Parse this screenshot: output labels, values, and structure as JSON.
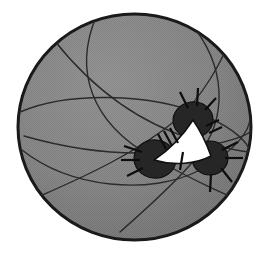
{
  "figure": {
    "kind": "spherical-triangle-diagram",
    "caption": "",
    "background_color": "#ffffff",
    "canvas": {
      "width": 268,
      "height": 255
    }
  },
  "sphere": {
    "label": "sphere",
    "center_x": 134.5,
    "center_y": 127,
    "radius_x": 116.5,
    "radius_y": 113,
    "fill_color": "#8a8a8a",
    "outline_color": "#1a1a1a",
    "outline_width": 3,
    "shading": "dithered-halftone-gray",
    "highlight_color": "#9b9b9b",
    "shadow_color": "#6f6f6f"
  },
  "great_circles": {
    "label": "great circle arcs",
    "stroke_color": "#2b2b2b",
    "stroke_width": 1.4,
    "count": 7,
    "paths": [
      "M 22 150 C 70 188, 150 196, 200 170 C 236 151, 250 130, 250 118",
      "M 20 112 C 66 92, 150 92, 205 116 C 238 130, 249 145, 250 152",
      "M 96 17 C 74 70, 90 122, 152 157 C 196 182, 232 198, 246 202",
      "M 188 20 C 228 66, 228 120, 196 158 C 172 187, 140 214, 120 232",
      "M 54 40 C 92 88, 140 124, 196 140 C 228 149, 244 152, 251 152",
      "M 40 196 C 86 176, 138 152, 176 120 C 204 96, 222 60, 230 40",
      "M 24 136 C 80 152, 140 158, 196 148 C 228 142, 246 136, 251 131"
    ]
  },
  "spherical_triangle": {
    "label": "spherical triangle",
    "fill_color": "#ffffff",
    "outline_color": "#111111",
    "outline_width": 1.6,
    "vertices": [
      {
        "name": "apex-vertex",
        "x": 193,
        "y": 120
      },
      {
        "name": "left-vertex",
        "x": 157,
        "y": 159
      },
      {
        "name": "right-vertex",
        "x": 209,
        "y": 157
      }
    ],
    "path": "M 193 120 C 184 134, 172 148, 154 160 C 174 166, 196 164, 211 156 C 206 142, 200 130, 193 120 Z"
  },
  "vertex_nodes": {
    "label": "vertex blobs",
    "fill_color": "#262626",
    "outline_color": "#111111",
    "nodes": [
      {
        "name": "vertex-node-top",
        "cx": 193,
        "cy": 120,
        "rx": 20,
        "ry": 18,
        "rotation": -8
      },
      {
        "name": "vertex-node-left",
        "cx": 155,
        "cy": 159,
        "rx": 21,
        "ry": 19,
        "rotation": 6
      },
      {
        "name": "vertex-node-right",
        "cx": 210,
        "cy": 158,
        "rx": 18,
        "ry": 17,
        "rotation": -4
      }
    ]
  },
  "tick_marks": {
    "label": "tick marks / hatch marks",
    "stroke_color": "#0d0d0d",
    "stroke_width": 2.2,
    "side_hatches": [
      {
        "name": "hatch-left-side-1",
        "x1": 170,
        "y1": 128,
        "x2": 178,
        "y2": 143
      },
      {
        "name": "hatch-left-side-2",
        "x1": 164,
        "y1": 131,
        "x2": 172,
        "y2": 146
      },
      {
        "name": "hatch-left-side-3",
        "x1": 158,
        "y1": 134,
        "x2": 166,
        "y2": 149
      },
      {
        "name": "hatch-right-side-1",
        "x1": 206,
        "y1": 126,
        "x2": 219,
        "y2": 120
      },
      {
        "name": "hatch-right-side-2",
        "x1": 209,
        "y1": 133,
        "x2": 222,
        "y2": 127
      },
      {
        "name": "hatch-bottom-side-1",
        "x1": 183,
        "y1": 152,
        "x2": 180,
        "y2": 170
      }
    ],
    "radial_spikes": [
      {
        "name": "spike-top-1",
        "x1": 188,
        "y1": 108,
        "x2": 180,
        "y2": 92
      },
      {
        "name": "spike-top-2",
        "x1": 197,
        "y1": 106,
        "x2": 198,
        "y2": 88
      },
      {
        "name": "spike-top-3",
        "x1": 205,
        "y1": 110,
        "x2": 216,
        "y2": 98
      },
      {
        "name": "spike-left-1",
        "x1": 142,
        "y1": 152,
        "x2": 124,
        "y2": 146
      },
      {
        "name": "spike-left-2",
        "x1": 140,
        "y1": 160,
        "x2": 121,
        "y2": 160
      },
      {
        "name": "spike-left-3",
        "x1": 143,
        "y1": 168,
        "x2": 127,
        "y2": 176
      },
      {
        "name": "spike-right-1",
        "x1": 222,
        "y1": 150,
        "x2": 238,
        "y2": 142
      },
      {
        "name": "spike-right-2",
        "x1": 225,
        "y1": 158,
        "x2": 243,
        "y2": 158
      },
      {
        "name": "spike-right-3",
        "x1": 221,
        "y1": 168,
        "x2": 232,
        "y2": 182
      },
      {
        "name": "spike-right-4",
        "x1": 211,
        "y1": 174,
        "x2": 210,
        "y2": 192
      }
    ]
  }
}
